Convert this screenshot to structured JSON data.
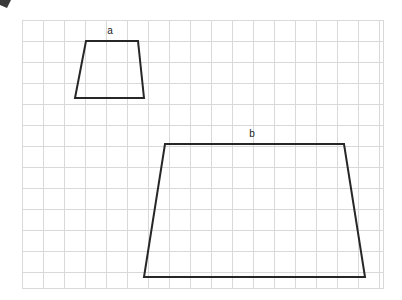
{
  "figure": {
    "background_color": "#ffffff",
    "shape_stroke_color": "#272727",
    "grid_line_color": "#d9d9d9",
    "label_color": "#1b1b1b"
  },
  "grid": {
    "x_start": 22,
    "y_start": 20,
    "x_end": 383,
    "y_end": 288,
    "cell_size": 21,
    "columns": 17,
    "rows": 13
  },
  "shapes": [
    {
      "label": "a",
      "type": "trapezoid",
      "label_x": 110,
      "label_y": 31,
      "points": "86,41 138,41 144,98 75,98",
      "vertices": [
        {
          "name": "top-left",
          "x": 86,
          "y": 41
        },
        {
          "name": "top-right",
          "x": 138,
          "y": 41
        },
        {
          "name": "bottom-right",
          "x": 144,
          "y": 98
        },
        {
          "name": "bottom-left",
          "x": 75,
          "y": 98
        }
      ]
    },
    {
      "label": "b",
      "type": "trapezoid",
      "label_x": 252,
      "label_y": 134,
      "points": "165,144 344,144 365,277 144,277",
      "vertices": [
        {
          "name": "top-left",
          "x": 165,
          "y": 144
        },
        {
          "name": "top-right",
          "x": 344,
          "y": 144
        },
        {
          "name": "bottom-right",
          "x": 365,
          "y": 277
        },
        {
          "name": "bottom-left",
          "x": 144,
          "y": 277
        }
      ]
    }
  ],
  "artifact": {
    "name": "corner-smudge",
    "x": 0,
    "y": 0,
    "width": 11,
    "height": 8
  }
}
